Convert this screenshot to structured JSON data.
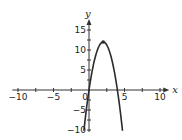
{
  "chart_data": {
    "type": "line",
    "title": "",
    "xlabel": "x",
    "ylabel": "y",
    "function": "y = -3x^2 + 12x",
    "xlim": [
      -10,
      10
    ],
    "ylim": [
      -10,
      15
    ],
    "x_ticks": [
      -10,
      -5,
      0,
      5,
      10
    ],
    "y_ticks": [
      -10,
      -5,
      5,
      10,
      15
    ],
    "x_tick_labels": [
      "−10",
      "−5",
      "0",
      "5",
      "10"
    ],
    "y_tick_labels": [
      "−10",
      "−5",
      "5",
      "10",
      "15"
    ],
    "grid": false,
    "legend": null,
    "series": [
      {
        "name": "parabola",
        "x": [
          -0.72,
          -0.5,
          0,
          0.5,
          1,
          1.5,
          2,
          2.5,
          3,
          3.5,
          4,
          4.5,
          4.72
        ],
        "y": [
          -10.2,
          -6.75,
          0,
          5.25,
          9,
          11.25,
          12,
          11.25,
          9,
          5.25,
          0,
          -6.75,
          -10.2
        ]
      }
    ],
    "annotations": [
      {
        "type": "point",
        "x": 2,
        "y": 12,
        "label": "vertex"
      }
    ]
  },
  "axes": {
    "x_label": "x",
    "y_label": "y",
    "origin_label": "0"
  }
}
